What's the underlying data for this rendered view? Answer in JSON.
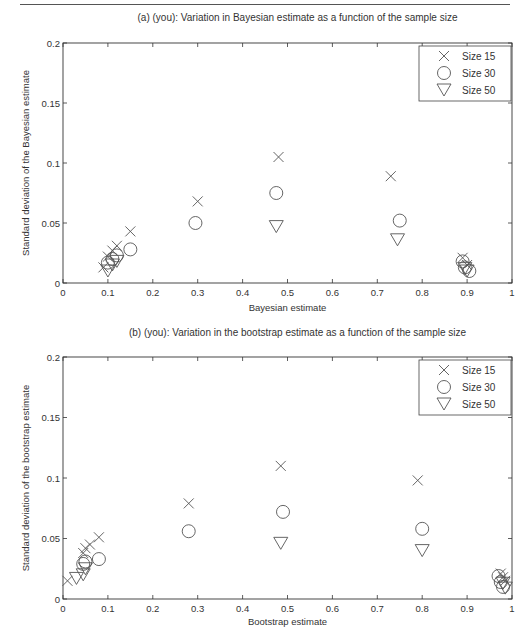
{
  "chart_data": [
    {
      "type": "scatter",
      "id": "a",
      "title": "(a) (you): Variation in Bayesian estimate as a function of the sample size",
      "xlabel": "Bayesian estimate",
      "ylabel": "Standard deviation of the Bayesian estimate",
      "xlim": [
        0,
        1
      ],
      "ylim": [
        0,
        0.2
      ],
      "xticks": [
        "0",
        "0.1",
        "0.2",
        "0.3",
        "0.4",
        "0.5",
        "0.6",
        "0.7",
        "0.8",
        "0.9",
        "1"
      ],
      "yticks": [
        "0",
        "0.05",
        "0.1",
        "0.15",
        "0.2"
      ],
      "grid": false,
      "legend_position": "upper right",
      "series": [
        {
          "name": "Size 15",
          "marker": "x",
          "x": [
            0.09,
            0.1,
            0.11,
            0.12,
            0.15,
            0.3,
            0.48,
            0.73,
            0.89,
            0.9
          ],
          "y": [
            0.013,
            0.022,
            0.027,
            0.031,
            0.043,
            0.068,
            0.105,
            0.089,
            0.021,
            0.015
          ]
        },
        {
          "name": "Size 30",
          "marker": "circle",
          "x": [
            0.1,
            0.11,
            0.12,
            0.15,
            0.295,
            0.475,
            0.75,
            0.89,
            0.895,
            0.905
          ],
          "y": [
            0.017,
            0.02,
            0.023,
            0.028,
            0.05,
            0.075,
            0.052,
            0.018,
            0.013,
            0.01
          ]
        },
        {
          "name": "Size 50",
          "marker": "triangle-down",
          "x": [
            0.1,
            0.11,
            0.12,
            0.475,
            0.745,
            0.895,
            0.9
          ],
          "y": [
            0.01,
            0.015,
            0.018,
            0.047,
            0.036,
            0.012,
            0.01
          ]
        }
      ]
    },
    {
      "type": "scatter",
      "id": "b",
      "title": "(b) (you): Variation in the bootstrap estimate as a function of the sample size",
      "xlabel": "Bootstrap estimate",
      "ylabel": "Standard deviation of the bootstrap estimate",
      "xlim": [
        0,
        1
      ],
      "ylim": [
        0,
        0.2
      ],
      "xticks": [
        "0",
        "0.1",
        "0.2",
        "0.3",
        "0.4",
        "0.5",
        "0.6",
        "0.7",
        "0.8",
        "0.9",
        "1"
      ],
      "yticks": [
        "0",
        "0.05",
        "0.1",
        "0.15",
        "0.2"
      ],
      "grid": false,
      "legend_position": "upper right",
      "series": [
        {
          "name": "Size 15",
          "marker": "x",
          "x": [
            0.01,
            0.045,
            0.05,
            0.06,
            0.08,
            0.28,
            0.485,
            0.79,
            0.975,
            0.98,
            0.985
          ],
          "y": [
            0.015,
            0.038,
            0.042,
            0.045,
            0.051,
            0.079,
            0.11,
            0.098,
            0.021,
            0.018,
            0.015
          ]
        },
        {
          "name": "Size 30",
          "marker": "circle",
          "x": [
            0.045,
            0.05,
            0.08,
            0.28,
            0.49,
            0.8,
            0.97,
            0.975,
            0.98
          ],
          "y": [
            0.029,
            0.031,
            0.033,
            0.056,
            0.072,
            0.058,
            0.019,
            0.014,
            0.01
          ]
        },
        {
          "name": "Size 50",
          "marker": "triangle-down",
          "x": [
            0.03,
            0.045,
            0.05,
            0.485,
            0.8,
            0.98,
            0.985
          ],
          "y": [
            0.017,
            0.02,
            0.025,
            0.046,
            0.04,
            0.013,
            0.009
          ]
        }
      ]
    }
  ]
}
